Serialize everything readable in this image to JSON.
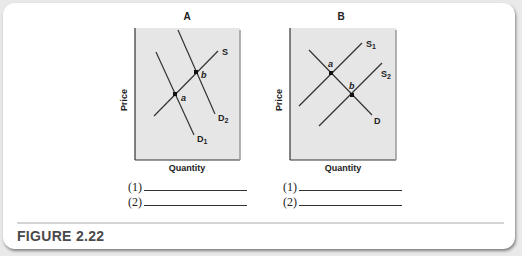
{
  "figure": {
    "caption": "FIGURE 2.22",
    "panels": [
      {
        "title": "A",
        "xlabel": "Quantity",
        "ylabel": "Price",
        "curves": {
          "supply": "S",
          "demand1": "D",
          "demand1_sub": "1",
          "demand2": "D",
          "demand2_sub": "2"
        },
        "points": {
          "a": "a",
          "b": "b"
        },
        "blanks": [
          "(1)",
          "(2)"
        ]
      },
      {
        "title": "B",
        "xlabel": "Quantity",
        "ylabel": "Price",
        "curves": {
          "supply1": "S",
          "supply1_sub": "1",
          "supply2": "S",
          "supply2_sub": "2",
          "demand": "D"
        },
        "points": {
          "a": "a",
          "b": "b"
        },
        "blanks": [
          "(1)",
          "(2)"
        ]
      }
    ]
  },
  "colors": {
    "panel_bg": "#e6e6e6",
    "line": "#333333",
    "caption": "#4a4a4a"
  }
}
